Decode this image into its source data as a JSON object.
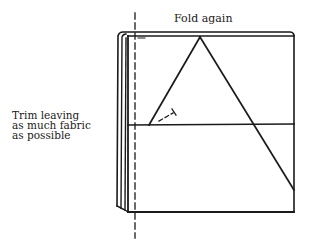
{
  "diagram": {
    "title": "Fold again",
    "annotation": {
      "lines": [
        "Trim leaving",
        "as much fabric",
        "as possible"
      ]
    },
    "colors": {
      "ink": "#1a1a1a",
      "paper": "#ffffff"
    },
    "elements": {
      "folded_fabric": "folded square of fabric with layered left edge",
      "triangle": "triangle fold lines from top apex",
      "horizontal_fold": "horizontal crease line across middle",
      "trim_line": "vertical dashed trim guide line",
      "small_marker": "short dashed line with tick mark"
    }
  }
}
